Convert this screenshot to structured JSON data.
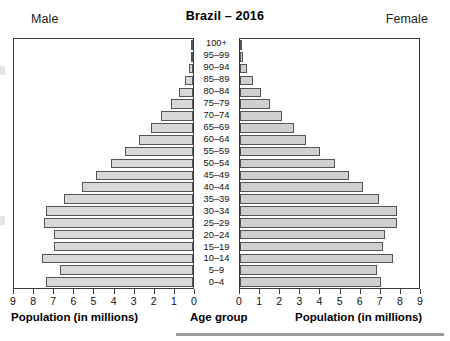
{
  "chart": {
    "title": "Brazil – 2016",
    "left_header": "Male",
    "right_header": "Female",
    "center_axis_title": "Age group",
    "left_axis_title": "Population (in millions)",
    "right_axis_title": "Population (in millions)"
  },
  "axis": {
    "left_ticks": [
      "9",
      "8",
      "7",
      "6",
      "5",
      "4",
      "3",
      "2",
      "1",
      "0"
    ],
    "right_ticks": [
      "0",
      "1",
      "2",
      "3",
      "4",
      "5",
      "6",
      "7",
      "8",
      "9"
    ]
  },
  "chart_data": {
    "type": "bar",
    "subtype": "population-pyramid",
    "title": "Brazil – 2016",
    "xlabel": "Population (in millions)",
    "ylabel": "Age group",
    "xlim": [
      0,
      9
    ],
    "grid": false,
    "legend": [
      "Male",
      "Female"
    ],
    "legend_position": "top-left and top-right",
    "categories": [
      "100+",
      "95–99",
      "90–94",
      "85–89",
      "80–84",
      "75–79",
      "70–74",
      "65–69",
      "60–64",
      "55–59",
      "50–54",
      "45–49",
      "40–44",
      "35–39",
      "30–34",
      "25–29",
      "20–24",
      "15–19",
      "10–14",
      "5–9",
      "0–4"
    ],
    "series": [
      {
        "name": "Male",
        "color": "#d8d8d8",
        "values": [
          0.02,
          0.08,
          0.2,
          0.4,
          0.7,
          1.1,
          1.6,
          2.1,
          2.7,
          3.4,
          4.1,
          4.8,
          5.5,
          6.4,
          7.3,
          7.4,
          6.9,
          6.9,
          7.5,
          6.6,
          7.3
        ]
      },
      {
        "name": "Female",
        "color": "#d0d0d0",
        "values": [
          0.04,
          0.15,
          0.35,
          0.65,
          1.05,
          1.5,
          2.1,
          2.7,
          3.3,
          4.0,
          4.7,
          5.4,
          6.1,
          6.9,
          7.8,
          7.8,
          7.2,
          7.1,
          7.6,
          6.8,
          7.0
        ]
      }
    ]
  }
}
